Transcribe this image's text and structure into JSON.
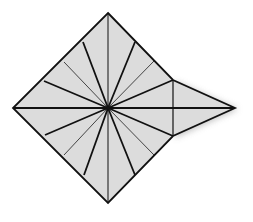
{
  "diagram": {
    "type": "origami-crease-pattern",
    "colors": {
      "fill": "#dcdcdc",
      "stroke": "#111111",
      "thin_stroke": "#444444",
      "shadow": "#bbbbbb",
      "background": "#ffffff"
    },
    "center": [
      108,
      108
    ],
    "square": {
      "top": [
        108,
        13
      ],
      "right": [
        203,
        108
      ],
      "bottom": [
        108,
        203
      ],
      "left": [
        13,
        108
      ]
    },
    "flap": {
      "upper": [
        173,
        80
      ],
      "lower": [
        173,
        136
      ],
      "tip": [
        235,
        108
      ]
    },
    "thick_rays_to": [
      [
        108,
        13
      ],
      [
        83,
        42
      ],
      [
        44,
        81
      ],
      [
        13,
        108
      ],
      [
        45,
        135
      ],
      [
        84,
        175
      ],
      [
        108,
        203
      ],
      [
        135,
        175
      ],
      [
        173,
        136
      ],
      [
        235,
        108
      ],
      [
        173,
        80
      ],
      [
        135,
        42
      ]
    ],
    "thin_rays_to": [
      [
        64,
        62
      ],
      [
        64,
        155
      ],
      [
        154,
        155
      ],
      [
        154,
        61
      ]
    ],
    "flap_vertical_crease": [
      [
        173,
        80
      ],
      [
        173,
        136
      ]
    ]
  }
}
